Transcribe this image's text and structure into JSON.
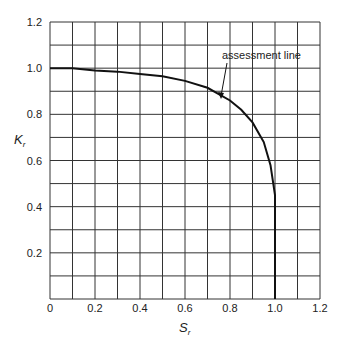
{
  "chart_data": {
    "type": "line",
    "title": "",
    "xlabel": "S_r",
    "ylabel": "K_r",
    "xlim": [
      0,
      1.2
    ],
    "ylim": [
      0,
      1.2
    ],
    "grid": true,
    "x_ticks": [
      "0",
      "0.2",
      "0.4",
      "0.6",
      "0.8",
      "1.0",
      "1.2"
    ],
    "y_ticks": [
      "0.2",
      "0.4",
      "0.6",
      "0.8",
      "1.0",
      "1.2"
    ],
    "series": [
      {
        "name": "assessment line",
        "x": [
          0,
          0.1,
          0.2,
          0.3,
          0.4,
          0.5,
          0.6,
          0.7,
          0.8,
          0.85,
          0.9,
          0.95,
          0.98,
          1.0,
          1.0
        ],
        "y": [
          1.0,
          1.0,
          0.99,
          0.985,
          0.975,
          0.965,
          0.945,
          0.915,
          0.86,
          0.82,
          0.765,
          0.68,
          0.58,
          0.45,
          0.0
        ]
      }
    ],
    "annotations": [
      {
        "text": "assessment line",
        "arrow_to": [
          0.75,
          0.88
        ]
      }
    ]
  },
  "labels": {
    "x_axis": "S",
    "x_sub": "r",
    "y_axis": "K",
    "y_sub": "r",
    "annotation": "assessment line"
  },
  "ticks": {
    "x": [
      "0",
      "0.2",
      "0.4",
      "0.6",
      "0.8",
      "1.0",
      "1.2"
    ],
    "y": [
      "0.2",
      "0.4",
      "0.6",
      "0.8",
      "1.0",
      "1.2"
    ]
  }
}
